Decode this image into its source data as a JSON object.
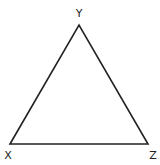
{
  "diagram": {
    "type": "triangle",
    "vertices": [
      {
        "label": "X",
        "x": 10,
        "y": 144
      },
      {
        "label": "Y",
        "x": 79,
        "y": 25
      },
      {
        "label": "Z",
        "x": 148,
        "y": 144
      }
    ],
    "labels": {
      "x": "X",
      "y": "Y",
      "z": "Z"
    },
    "stroke_color": "#222222",
    "background": "#ffffff"
  }
}
